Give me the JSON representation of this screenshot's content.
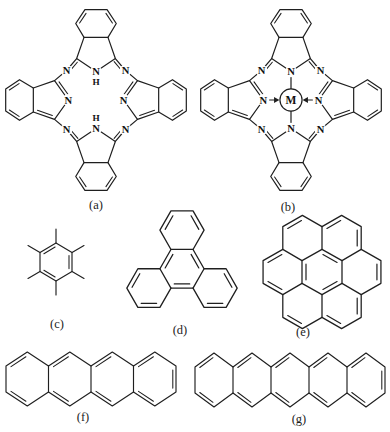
{
  "figure": {
    "background_color": "#ffffff",
    "line_color": "#1f1f1f",
    "captions": {
      "a": "(a)",
      "b": "(b)",
      "c": "(c)",
      "d": "(d)",
      "e": "(e)",
      "f": "(f)",
      "g": "(g)"
    },
    "atoms": {
      "nitrogen": "N",
      "hydrogen": "H",
      "metal": "M"
    }
  }
}
